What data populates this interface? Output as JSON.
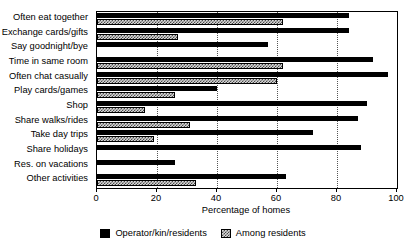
{
  "chart_data": {
    "type": "bar",
    "orientation": "horizontal",
    "title": "",
    "xlabel": "Percentage of homes",
    "ylabel": "",
    "xlim": [
      0,
      100
    ],
    "xticks": [
      0,
      20,
      40,
      60,
      80,
      100
    ],
    "grid": "vertical dotted gridlines at 20, 40, 60, 80",
    "legend_position": "bottom-center",
    "categories": [
      "Often eat together",
      "Exchange cards/gifts",
      "Say goodnight/bye",
      "Time in same room",
      "Often chat casually",
      "Play cards/games",
      "Shop",
      "Share walks/rides",
      "Take day trips",
      "Share holidays",
      "Res. on vacations",
      "Other activities"
    ],
    "series": [
      {
        "name": "Operator/kin/residents",
        "pattern": "solid-black",
        "color": "#000000",
        "values": [
          84,
          84,
          57,
          92,
          97,
          40,
          90,
          87,
          72,
          88,
          26,
          63
        ]
      },
      {
        "name": "Among residents",
        "pattern": "hatched-gray",
        "color": "#d8d8d8",
        "values": [
          62,
          27,
          0,
          62,
          60,
          26,
          16,
          31,
          19,
          0,
          0,
          33
        ]
      }
    ]
  },
  "axis": {
    "tick_labels": [
      "0",
      "20",
      "40",
      "60",
      "80",
      "100"
    ],
    "x_title": "Percentage of homes"
  },
  "legend": {
    "items": [
      {
        "label": "Operator/kin/residents"
      },
      {
        "label": "Among residents"
      }
    ]
  }
}
